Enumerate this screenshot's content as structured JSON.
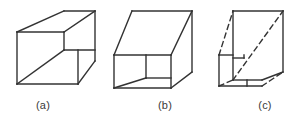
{
  "figure": {
    "background_color": "#ffffff",
    "stroke_color": "#333333",
    "stroke_width": 1.4,
    "width": 305,
    "height": 120,
    "captions": [
      {
        "id": "a",
        "label": "(a)",
        "description": "Necker-style wire cube, solid lines only"
      },
      {
        "id": "b",
        "label": "(b)",
        "description": "Wire cube seen from the opposite corner, solid lines only"
      },
      {
        "id": "c",
        "label": "(c)",
        "description": "Cube with hidden edges drawn as dashed lines"
      }
    ],
    "panels": [
      {
        "id": "a",
        "name": "cube-a",
        "style": "solid",
        "solid_lines": [
          [
            17,
            32,
            64,
            11
          ],
          [
            64,
            11,
            95,
            11
          ],
          [
            95,
            11,
            95,
            61
          ],
          [
            17,
            32,
            17,
            84
          ],
          [
            17,
            84,
            78,
            84
          ],
          [
            78,
            84,
            95,
            61
          ],
          [
            17,
            32,
            64,
            32
          ],
          [
            64,
            32,
            95,
            11
          ],
          [
            64,
            32,
            64,
            50
          ],
          [
            64,
            50,
            95,
            50
          ],
          [
            17,
            84,
            64,
            50
          ],
          [
            78,
            84,
            78,
            50
          ]
        ],
        "dashed_lines": []
      },
      {
        "id": "b",
        "name": "cube-b",
        "style": "solid",
        "solid_lines": [
          [
            132,
            11,
            192,
            11
          ],
          [
            192,
            11,
            192,
            72
          ],
          [
            114,
            55,
            132,
            11
          ],
          [
            114,
            55,
            114,
            88
          ],
          [
            114,
            88,
            171,
            88
          ],
          [
            171,
            88,
            192,
            72
          ],
          [
            114,
            55,
            171,
            55
          ],
          [
            171,
            55,
            192,
            11
          ],
          [
            171,
            55,
            171,
            88
          ],
          [
            146,
            55,
            146,
            78
          ],
          [
            114,
            88,
            146,
            78
          ],
          [
            146,
            78,
            171,
            78
          ]
        ],
        "dashed_lines": []
      },
      {
        "id": "c",
        "name": "cube-c",
        "style": "mixed",
        "solid_lines": [
          [
            233,
            11,
            283,
            11
          ],
          [
            283,
            11,
            283,
            72
          ],
          [
            233,
            11,
            233,
            80
          ],
          [
            233,
            80,
            262,
            80
          ],
          [
            262,
            80,
            283,
            72
          ],
          [
            219,
            55,
            233,
            55
          ],
          [
            219,
            55,
            219,
            86
          ],
          [
            219,
            86,
            262,
            86
          ],
          [
            244,
            55,
            244,
            58
          ],
          [
            233,
            58,
            244,
            58
          ],
          [
            247,
            80,
            247,
            86
          ]
        ],
        "dashed_lines": [
          [
            219,
            55,
            233,
            11
          ],
          [
            219,
            86,
            233,
            80
          ],
          [
            233,
            80,
            283,
            11
          ],
          [
            262,
            86,
            283,
            72
          ]
        ]
      }
    ]
  }
}
